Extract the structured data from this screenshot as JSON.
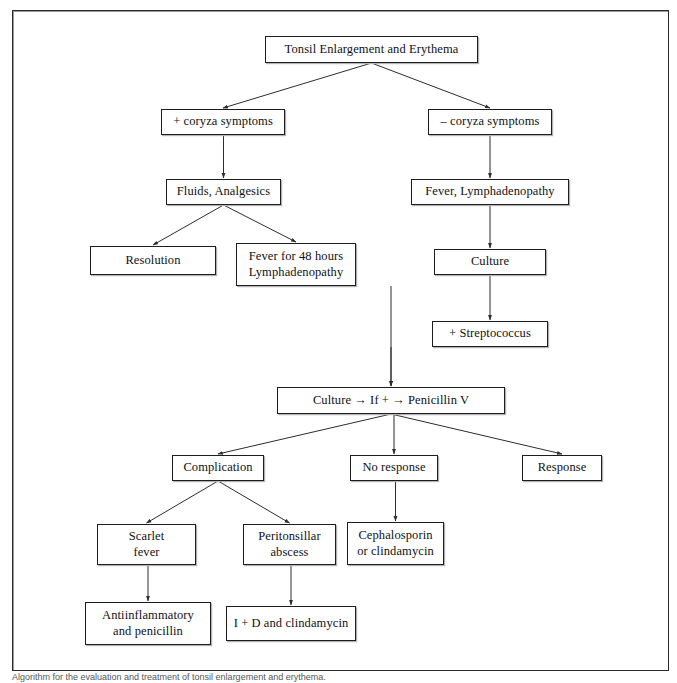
{
  "figure": {
    "title": "Tonsil Enlargement and Erythema",
    "caption": "Algorithm for the evaluation and treatment of tonsil enlargement and erythema.",
    "border_color": "#2b2b2b",
    "node_border_color": "#1d1d1d",
    "connector_color": "#333333",
    "background": "#ffffff"
  },
  "chart_data": {
    "type": "diagram",
    "subtype": "flowchart",
    "title": "Tonsil Enlargement and Erythema",
    "nodes": [
      {
        "id": "root",
        "label": "Tonsil Enlargement and Erythema",
        "x": 265,
        "y": 36,
        "w": 213,
        "h": 27
      },
      {
        "id": "coryza_pos",
        "label": "+ coryza symptoms",
        "x": 161,
        "y": 109,
        "w": 124,
        "h": 26
      },
      {
        "id": "coryza_neg",
        "label": "– coryza symptoms",
        "x": 428,
        "y": 109,
        "w": 124,
        "h": 26
      },
      {
        "id": "fluids",
        "label": "Fluids, Analgesics",
        "x": 166,
        "y": 179,
        "w": 115,
        "h": 26
      },
      {
        "id": "fever_lymph",
        "label": "Fever, Lymphadenopathy",
        "x": 411,
        "y": 179,
        "w": 158,
        "h": 26
      },
      {
        "id": "resolution",
        "label": "Resolution",
        "x": 90,
        "y": 246,
        "w": 126,
        "h": 29
      },
      {
        "id": "fever48",
        "label": "Fever for 48 hours\nLymphadenopathy",
        "x": 236,
        "y": 243,
        "w": 120,
        "h": 43
      },
      {
        "id": "culture_right",
        "label": "Culture",
        "x": 434,
        "y": 249,
        "w": 112,
        "h": 26
      },
      {
        "id": "strep_pos",
        "label": "+ Streptococcus",
        "x": 432,
        "y": 321,
        "w": 116,
        "h": 26
      },
      {
        "id": "culture_pen",
        "label": "Culture → If + → Penicillin V",
        "x": 277,
        "y": 387,
        "w": 228,
        "h": 27
      },
      {
        "id": "complication",
        "label": "Complication",
        "x": 172,
        "y": 455,
        "w": 92,
        "h": 26
      },
      {
        "id": "no_response",
        "label": "No response",
        "x": 350,
        "y": 455,
        "w": 88,
        "h": 26
      },
      {
        "id": "response",
        "label": "Response",
        "x": 522,
        "y": 455,
        "w": 80,
        "h": 26
      },
      {
        "id": "scarlet",
        "label": "Scarlet\nfever",
        "x": 97,
        "y": 524,
        "w": 99,
        "h": 41
      },
      {
        "id": "peritonsillar",
        "label": "Peritonsillar\nabscess",
        "x": 243,
        "y": 524,
        "w": 93,
        "h": 41
      },
      {
        "id": "cephalosporin",
        "label": "Cephalosporin\nor clindamycin",
        "x": 347,
        "y": 522,
        "w": 97,
        "h": 43
      },
      {
        "id": "antiinflam",
        "label": "Antiinflammatory\nand penicillin",
        "x": 85,
        "y": 602,
        "w": 126,
        "h": 43
      },
      {
        "id": "incision",
        "label": "I + D and clindamycin",
        "x": 226,
        "y": 606,
        "w": 130,
        "h": 35
      }
    ],
    "edges": [
      {
        "from": "root",
        "to": "coryza_pos",
        "style": "diagonal"
      },
      {
        "from": "root",
        "to": "coryza_neg",
        "style": "diagonal"
      },
      {
        "from": "coryza_pos",
        "to": "fluids",
        "style": "vertical"
      },
      {
        "from": "coryza_neg",
        "to": "fever_lymph",
        "style": "vertical"
      },
      {
        "from": "fluids",
        "to": "resolution",
        "style": "diagonal"
      },
      {
        "from": "fluids",
        "to": "fever48",
        "style": "diagonal"
      },
      {
        "from": "fever_lymph",
        "to": "culture_right",
        "style": "vertical"
      },
      {
        "from": "culture_right",
        "to": "strep_pos",
        "style": "vertical"
      },
      {
        "from": "fever48",
        "to": "culture_pen",
        "style": "vertical"
      },
      {
        "from": "strep_pos",
        "to": "culture_pen",
        "style": "vertical"
      },
      {
        "from": "culture_pen",
        "to": "complication",
        "style": "diagonal"
      },
      {
        "from": "culture_pen",
        "to": "no_response",
        "style": "vertical"
      },
      {
        "from": "culture_pen",
        "to": "response",
        "style": "diagonal"
      },
      {
        "from": "complication",
        "to": "scarlet",
        "style": "diagonal"
      },
      {
        "from": "complication",
        "to": "peritonsillar",
        "style": "diagonal"
      },
      {
        "from": "no_response",
        "to": "cephalosporin",
        "style": "vertical"
      },
      {
        "from": "scarlet",
        "to": "antiinflam",
        "style": "vertical"
      },
      {
        "from": "peritonsillar",
        "to": "incision",
        "style": "vertical"
      }
    ]
  }
}
